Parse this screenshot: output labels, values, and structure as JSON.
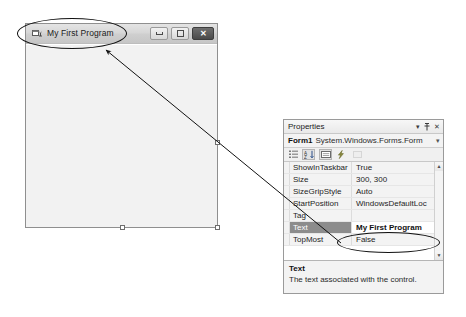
{
  "form": {
    "title": "My First Program",
    "icon": "form-designer-icon",
    "buttons": {
      "minimize": "Minimize",
      "maximize": "Maximize",
      "close": "Close"
    }
  },
  "properties_panel": {
    "header": {
      "title": "Properties",
      "dropdown_icon": "chevron-down-icon",
      "pin_icon": "pin-icon",
      "close_icon": "close-icon"
    },
    "object": {
      "name": "Form1",
      "type": "System.Windows.Forms.Form",
      "caret": "▾"
    },
    "toolbar": [
      {
        "name": "categorized-button",
        "label": "Categorized"
      },
      {
        "name": "alphabetical-button",
        "label": "Alphabetical"
      },
      {
        "name": "properties-button",
        "label": "Properties"
      },
      {
        "name": "events-button",
        "label": "Events"
      },
      {
        "name": "property-pages-button",
        "label": "Property Pages"
      }
    ],
    "columns": [
      "Property",
      "Value"
    ],
    "rows": [
      {
        "name": "ShowInTaskbar",
        "value": "True",
        "selected": false
      },
      {
        "name": "Size",
        "value": "300, 300",
        "selected": false
      },
      {
        "name": "SizeGripStyle",
        "value": "Auto",
        "selected": false
      },
      {
        "name": "StartPosition",
        "value": "WindowsDefaultLoc",
        "selected": false
      },
      {
        "name": "Tag",
        "value": "",
        "selected": false
      },
      {
        "name": "Text",
        "value": "My First Program",
        "selected": true
      },
      {
        "name": "TopMost",
        "value": "False",
        "selected": false
      }
    ],
    "scrollbar": {
      "up": "▲",
      "down": "▼"
    },
    "description": {
      "title": "Text",
      "text": "The text associated with the control."
    }
  },
  "annotations": {
    "ellipse_title": "highlight-form-title",
    "ellipse_value": "highlight-text-property-value",
    "arrow": "arrow-from-text-property-to-form-title"
  },
  "colors": {
    "selection": "#8c8c8c",
    "panel_bg": "#f3f3f3",
    "border": "#9a9a9a",
    "annotation": "#111111"
  }
}
